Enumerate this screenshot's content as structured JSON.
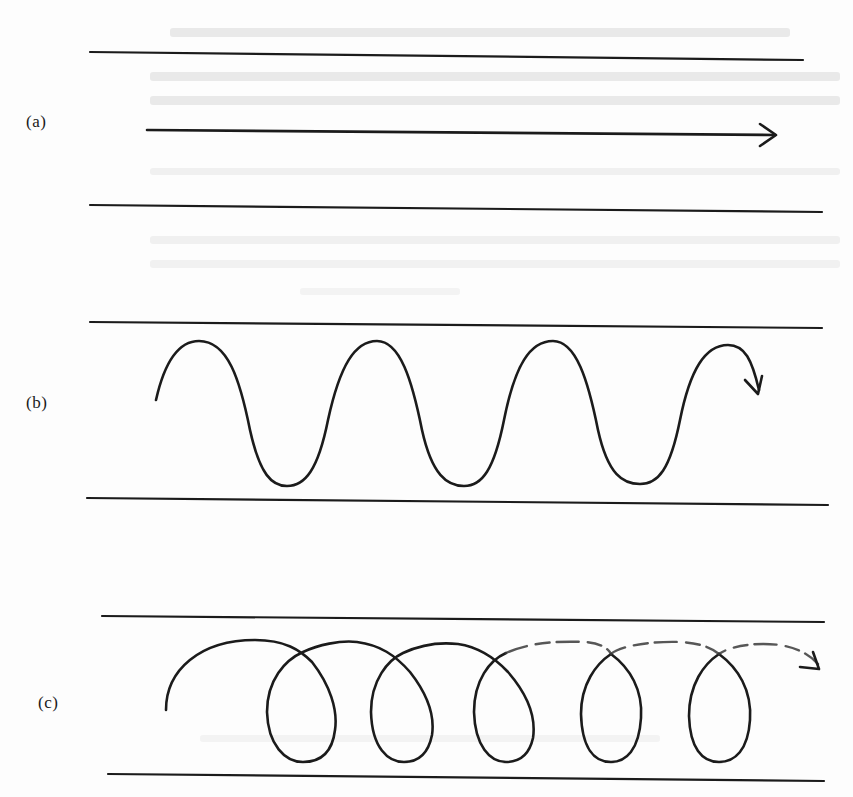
{
  "figure": {
    "panels": [
      {
        "id": "a",
        "label": "(a)",
        "motion": "straight-line",
        "description": "Straight arrow between two parallel boundary lines"
      },
      {
        "id": "b",
        "label": "(b)",
        "motion": "sinusoidal-wave",
        "description": "Sinusoidal (snake-like) path between two parallel boundary lines, ending in an arrow"
      },
      {
        "id": "c",
        "label": "(c)",
        "motion": "helical-coil",
        "description": "Helical/looping coil path between two parallel boundary lines, upper arcs drawn faded/dashed, ending in an arrow"
      }
    ],
    "colors": {
      "ink": "#1b1b1b",
      "paper": "#fdfdfd"
    }
  }
}
